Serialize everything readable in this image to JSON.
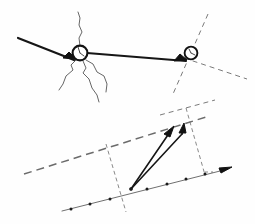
{
  "figure": {
    "background_color": "#fefefe",
    "ink_color": "#161616",
    "dash_color": "#6b6b6b",
    "thin_color": "#4a4a4a",
    "width": 255,
    "height": 224
  },
  "upper_panel": {
    "name": "impact-fracture-diagram",
    "nodes": [
      {
        "label": "left-node",
        "cx": 80,
        "cy": 53,
        "r": 7.5
      },
      {
        "label": "right-node",
        "cx": 191,
        "cy": 54,
        "r": 6.5
      }
    ],
    "arrows": [
      {
        "label": "incoming-arrow",
        "x1": 18,
        "y1": 38,
        "x2": 74,
        "y2": 59
      },
      {
        "label": "transfer-arrow",
        "x1": 86,
        "y1": 54,
        "x2": 185,
        "y2": 60
      }
    ],
    "crack_count": 4,
    "dashed_line_count": 2
  },
  "lower_panel": {
    "name": "vector-resolution-diagram",
    "origin": {
      "label": "origin",
      "x": 131,
      "y": 188
    },
    "vectors": [
      {
        "label": "resultant-vector",
        "x1": 131,
        "y1": 188,
        "x2": 173,
        "y2": 127
      },
      {
        "label": "component-vector",
        "x1": 131,
        "y1": 188,
        "x2": 183,
        "y2": 131
      }
    ],
    "axis": {
      "label": "tick-axis",
      "x1": 62,
      "y1": 211,
      "x2": 232,
      "y2": 168,
      "tick_count": 9,
      "has_arrowhead": true
    },
    "dashed_baseline": {
      "label": "upper-dashed-baseline",
      "x1": 24,
      "y1": 173,
      "x2": 205,
      "y2": 117
    },
    "dashed_verticals": 2,
    "construction_lines": 3
  },
  "legend": {
    "heavy_stroke": "solid arrow / vector",
    "thin_stroke": "crack propagation",
    "dashed_stroke": "construction line",
    "dotted_marks": "axis graduation"
  }
}
